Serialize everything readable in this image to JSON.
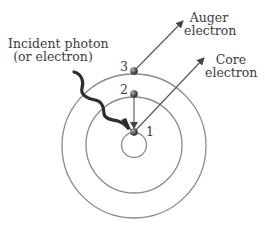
{
  "diagram": {
    "type": "auger-process-shell-diagram",
    "labels": {
      "incident_line1": "Incident photon",
      "incident_line2": "(or electron)",
      "auger_line1": "Auger",
      "auger_line2": "electron",
      "core_line1": "Core",
      "core_line2": "electron"
    },
    "levels": [
      {
        "id": "1",
        "label": "1"
      },
      {
        "id": "2",
        "label": "2"
      },
      {
        "id": "3",
        "label": "3"
      }
    ],
    "shells": 3,
    "colors": {
      "line": "#555555",
      "node": "#4a4a4a",
      "text": "#3c3c3c",
      "background": "#ffffff"
    }
  }
}
